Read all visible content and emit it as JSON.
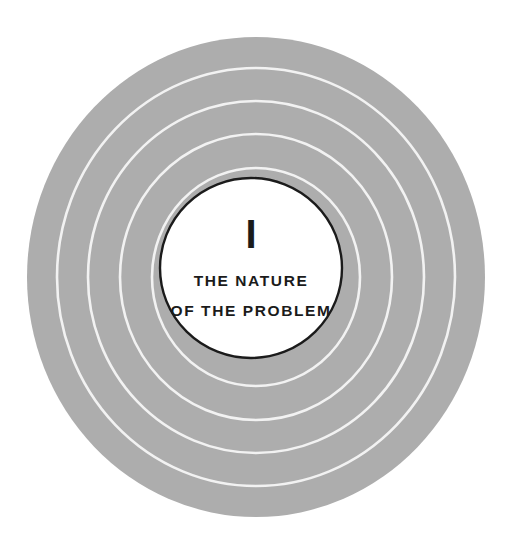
{
  "figure": {
    "name": "concentric-rings-chapter-opener",
    "background_color": "#ffffff",
    "disc_color": "#adadad",
    "ring_line_color": "#f2f2f2",
    "center_fill_color": "#ffffff",
    "center_stroke_color": "#1b1b1b",
    "text_color": "#1b1b1b",
    "geometry": {
      "center_x": 256,
      "center_y": 277,
      "disc_radius_x": 229,
      "disc_radius_y": 240,
      "center_circle_radius_x": 91,
      "center_circle_radius_y": 90,
      "center_circle_stroke_width": 2.4,
      "ring_line_width": 2.6,
      "ring_radii_x": [
        199,
        168,
        136,
        104
      ],
      "ring_radii_y": [
        209,
        176,
        143,
        109
      ]
    }
  },
  "chapter": {
    "numeral": "I",
    "title_lines": [
      "THE NATURE",
      "OF THE PROBLEM"
    ]
  }
}
